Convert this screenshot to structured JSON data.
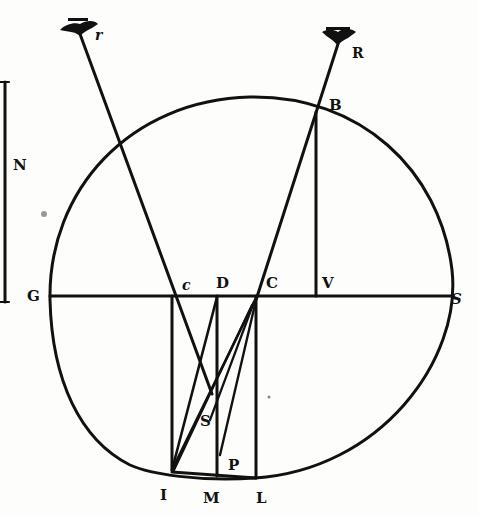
{
  "figure": {
    "colors": {
      "ink": "#111111",
      "paper": "#fdfdfb"
    },
    "labels": [
      {
        "id": "r",
        "text": "r",
        "x": 95,
        "y": 40,
        "size": 14,
        "italic": true
      },
      {
        "id": "R",
        "text": "R",
        "x": 352,
        "y": 58,
        "size": 14
      },
      {
        "id": "B",
        "text": "B",
        "x": 329,
        "y": 110,
        "size": 15
      },
      {
        "id": "N",
        "text": "N",
        "x": 13,
        "y": 170,
        "size": 15
      },
      {
        "id": "G",
        "text": "G",
        "x": 27,
        "y": 301,
        "size": 15
      },
      {
        "id": "c",
        "text": "c",
        "x": 182,
        "y": 290,
        "size": 14,
        "italic": true
      },
      {
        "id": "D",
        "text": "D",
        "x": 216,
        "y": 288,
        "size": 15
      },
      {
        "id": "C",
        "text": "C",
        "x": 266,
        "y": 288,
        "size": 15
      },
      {
        "id": "V",
        "text": "V",
        "x": 322,
        "y": 288,
        "size": 15
      },
      {
        "id": "S_right",
        "text": "S",
        "x": 451,
        "y": 304,
        "size": 15,
        "italic": true
      },
      {
        "id": "S",
        "text": "S",
        "x": 200,
        "y": 426,
        "size": 15
      },
      {
        "id": "P",
        "text": "P",
        "x": 228,
        "y": 470,
        "size": 15
      },
      {
        "id": "I",
        "text": "I",
        "x": 160,
        "y": 500,
        "size": 15
      },
      {
        "id": "M",
        "text": "M",
        "x": 203,
        "y": 503,
        "size": 15
      },
      {
        "id": "L",
        "text": "L",
        "x": 256,
        "y": 503,
        "size": 15
      }
    ]
  }
}
